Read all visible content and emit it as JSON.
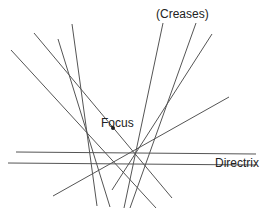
{
  "labels": {
    "creases": "(Creases)",
    "focus": "Focus",
    "directrix": "Directrix"
  },
  "colors": {
    "line": "#555555",
    "text": "#222222",
    "background": "#ffffff"
  },
  "focus_point": {
    "x": 113,
    "y": 128,
    "r": 2
  },
  "directrix_lines": [
    {
      "x1": 16,
      "y1": 152,
      "x2": 256,
      "y2": 154
    },
    {
      "x1": 8,
      "y1": 163,
      "x2": 256,
      "y2": 165
    }
  ],
  "crease_lines": [
    {
      "x1": 11,
      "y1": 50,
      "x2": 156,
      "y2": 208
    },
    {
      "x1": 34,
      "y1": 33,
      "x2": 172,
      "y2": 198
    },
    {
      "x1": 58,
      "y1": 39,
      "x2": 110,
      "y2": 207
    },
    {
      "x1": 72,
      "y1": 24,
      "x2": 97,
      "y2": 206
    },
    {
      "x1": 163,
      "y1": 23,
      "x2": 124,
      "y2": 208
    },
    {
      "x1": 196,
      "y1": 23,
      "x2": 130,
      "y2": 208
    },
    {
      "x1": 212,
      "y1": 34,
      "x2": 112,
      "y2": 190
    },
    {
      "x1": 229,
      "y1": 97,
      "x2": 53,
      "y2": 196
    }
  ]
}
